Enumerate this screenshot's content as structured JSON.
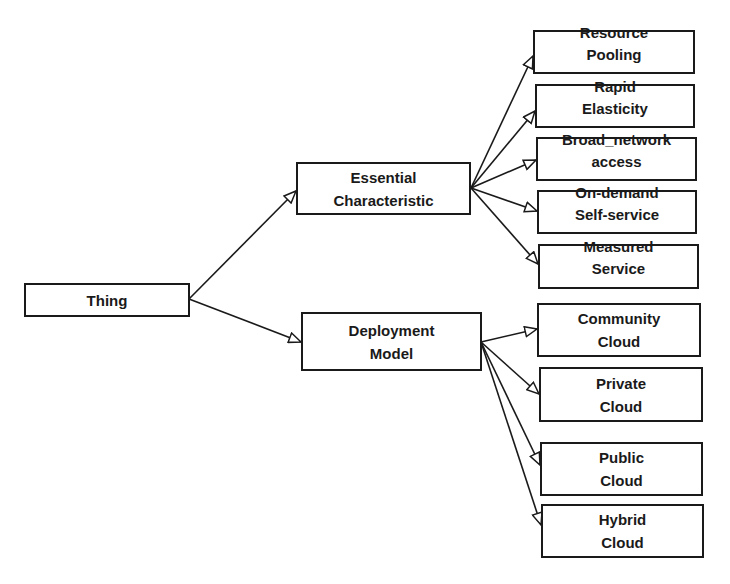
{
  "diagram": {
    "root": {
      "id": "thing",
      "lines": [
        "Thing"
      ]
    },
    "level1": [
      {
        "id": "essential",
        "lines": [
          "Essential",
          "Characteristic"
        ]
      },
      {
        "id": "deployment",
        "lines": [
          "Deployment",
          "Model"
        ]
      }
    ],
    "essential_children": [
      {
        "id": "resource-pooling",
        "lines": [
          "Resource",
          "Pooling"
        ]
      },
      {
        "id": "rapid-elasticity",
        "lines": [
          "Rapid",
          "Elasticity"
        ]
      },
      {
        "id": "broad-network",
        "lines": [
          "Broad_network",
          "access"
        ]
      },
      {
        "id": "on-demand",
        "lines": [
          "On-demand",
          "Self-service"
        ]
      },
      {
        "id": "measured-service",
        "lines": [
          "Measured",
          "Service"
        ]
      }
    ],
    "deployment_children": [
      {
        "id": "community-cloud",
        "lines": [
          "Community",
          "Cloud"
        ]
      },
      {
        "id": "private-cloud",
        "lines": [
          "Private",
          "Cloud"
        ]
      },
      {
        "id": "public-cloud",
        "lines": [
          "Public",
          "Cloud"
        ]
      },
      {
        "id": "hybrid-cloud",
        "lines": [
          "Hybrid",
          "Cloud"
        ]
      }
    ],
    "edges": [
      [
        "thing",
        "essential"
      ],
      [
        "thing",
        "deployment"
      ],
      [
        "essential",
        "resource-pooling"
      ],
      [
        "essential",
        "rapid-elasticity"
      ],
      [
        "essential",
        "broad-network"
      ],
      [
        "essential",
        "on-demand"
      ],
      [
        "essential",
        "measured-service"
      ],
      [
        "deployment",
        "community-cloud"
      ],
      [
        "deployment",
        "private-cloud"
      ],
      [
        "deployment",
        "public-cloud"
      ],
      [
        "deployment",
        "hybrid-cloud"
      ]
    ],
    "colors": {
      "stroke": "#1a1a1a",
      "background": "#ffffff"
    }
  }
}
